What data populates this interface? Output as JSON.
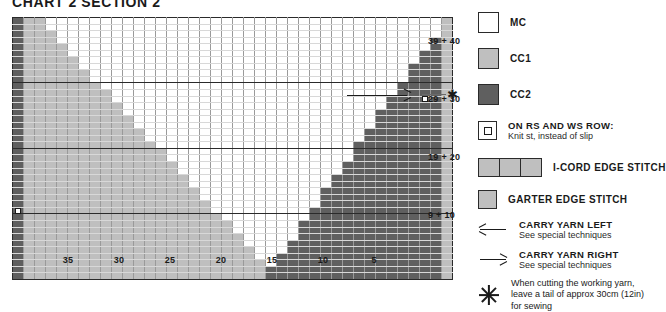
{
  "title": "CHART 2 SECTION 2",
  "chart_data": {
    "type": "heatmap",
    "title": "CHART 2 SECTION 2",
    "columns": 40,
    "rows": 40,
    "grid_on": true,
    "legend_position": "right",
    "colors": {
      "MC": "#ffffff",
      "CC1": "#bfbfbf",
      "CC2": "#5f5f5f"
    },
    "row_labels": [
      "39 + 40",
      "29 + 30",
      "19 + 20",
      "9 + 10"
    ],
    "row_label_rows": [
      36,
      26,
      16,
      6
    ],
    "col_labels": [
      "35",
      "30",
      "25",
      "20",
      "15",
      "10",
      "5"
    ],
    "col_label_cols": [
      35,
      30,
      25,
      20,
      15,
      10,
      5
    ],
    "xlabel": "",
    "ylabel": "",
    "markers": [
      {
        "name": "knit-st-marker-right",
        "row": 28,
        "col": 3
      },
      {
        "name": "knit-st-marker-left",
        "row": 11,
        "col": 40
      },
      {
        "name": "carry-yarn-right-arrow",
        "row": 28,
        "col_from": 10,
        "col_to": 3
      },
      {
        "name": "cut-yarn-asterisk",
        "row": 28,
        "col": 0
      }
    ]
  },
  "legend": {
    "items": [
      {
        "name": "mc",
        "swatch": "mc",
        "label": "MC"
      },
      {
        "name": "cc1",
        "swatch": "cc1",
        "label": "CC1"
      },
      {
        "name": "cc2",
        "swatch": "cc2",
        "label": "CC2"
      },
      {
        "name": "knit-st-marker",
        "swatch": "marker",
        "title": "ON RS AND WS ROW:",
        "sub": "Knit st, instead of slip"
      },
      {
        "name": "i-cord-edge",
        "swatch": "icord",
        "label": "I-CORD EDGE STITCH"
      },
      {
        "name": "garter-edge",
        "swatch": "cc1",
        "label": "GARTER EDGE STITCH"
      },
      {
        "name": "carry-yarn-left",
        "swatch": "arrow-left",
        "title": "CARRY YARN LEFT",
        "sub": "See special techniques"
      },
      {
        "name": "carry-yarn-right",
        "swatch": "arrow-right",
        "title": "CARRY YARN RIGHT",
        "sub": "See special techniques"
      },
      {
        "name": "cut-yarn-note",
        "swatch": "asterisk",
        "line1": "When cutting the working yarn,",
        "line2": "leave a tail of approx 30cm (12in)",
        "line3": "for sewing"
      }
    ]
  }
}
